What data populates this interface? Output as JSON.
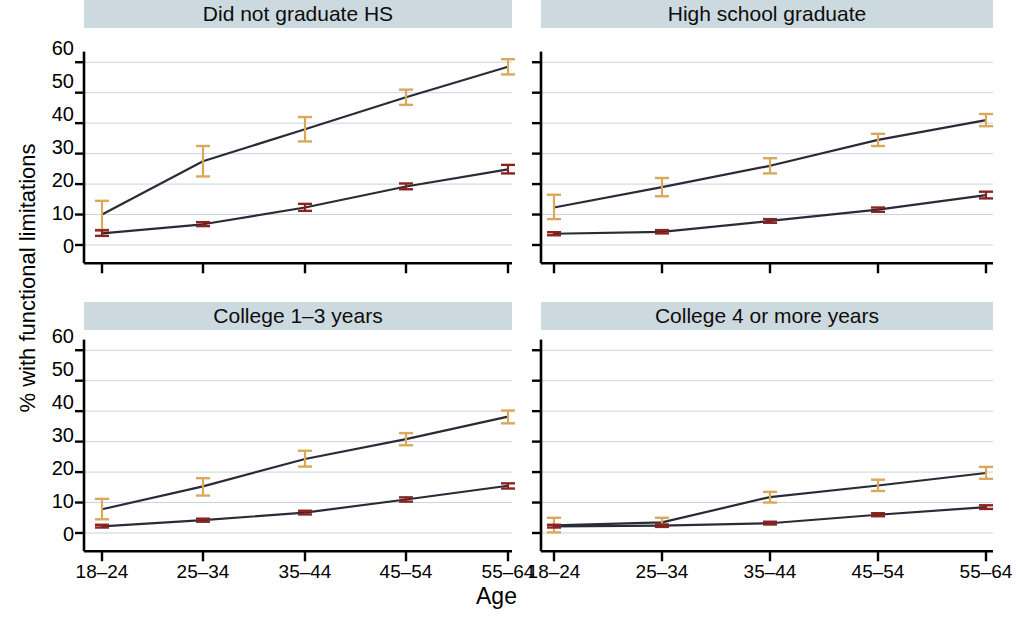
{
  "chart_data": {
    "type": "line",
    "title": "",
    "xlabel": "Age",
    "ylabel": "% with functional limitations",
    "categories": [
      "18–24",
      "25–34",
      "35–44",
      "45–54",
      "55–64"
    ],
    "ylim": [
      0,
      65
    ],
    "yticks": [
      0,
      10,
      20,
      30,
      40,
      50,
      60
    ],
    "ytick_labels": [
      "0",
      "10",
      "20",
      "30",
      "40",
      "50",
      "60"
    ],
    "grid": true,
    "grid_axis": "y",
    "legend_position": "none",
    "facet_layout": {
      "rows": 2,
      "cols": 2
    },
    "series_colors": {
      "upper": "#d9a85a",
      "lower": "#8c2323",
      "line": "#2b2b38"
    },
    "panels": [
      {
        "id": "did-not-graduate-hs",
        "title": "Did not graduate HS",
        "row": 0,
        "col": 0,
        "series": [
          {
            "name": "upper",
            "marker_color": "#d9a85a",
            "values": [
              10.0,
              27.5,
              38.0,
              48.5,
              58.5
            ],
            "err_low": [
              5.0,
              22.5,
              34.0,
              46.0,
              56.0
            ],
            "err_high": [
              14.5,
              32.5,
              42.0,
              51.0,
              61.0
            ]
          },
          {
            "name": "lower",
            "marker_color": "#8c2323",
            "values": [
              3.8,
              6.8,
              12.3,
              19.2,
              24.8
            ],
            "err_low": [
              3.0,
              6.2,
              11.2,
              18.3,
              23.5
            ],
            "err_high": [
              4.8,
              7.5,
              13.5,
              20.2,
              26.3
            ]
          }
        ]
      },
      {
        "id": "high-school-graduate",
        "title": "High school graduate",
        "row": 0,
        "col": 1,
        "series": [
          {
            "name": "upper",
            "marker_color": "#d9a85a",
            "values": [
              12.3,
              19.0,
              26.0,
              34.5,
              41.0
            ],
            "err_low": [
              8.5,
              16.0,
              23.5,
              32.5,
              39.0
            ],
            "err_high": [
              16.5,
              22.0,
              28.5,
              36.5,
              43.0
            ]
          },
          {
            "name": "lower",
            "marker_color": "#8c2323",
            "values": [
              3.7,
              4.3,
              7.9,
              11.6,
              16.4
            ],
            "err_low": [
              3.2,
              3.8,
              7.3,
              10.9,
              15.3
            ],
            "err_high": [
              4.2,
              4.9,
              8.5,
              12.3,
              17.5
            ]
          }
        ]
      },
      {
        "id": "college-1-3-years",
        "title": "College 1–3 years",
        "row": 1,
        "col": 0,
        "series": [
          {
            "name": "upper",
            "marker_color": "#d9a85a",
            "values": [
              7.8,
              15.3,
              24.3,
              30.8,
              38.2
            ],
            "err_low": [
              4.5,
              12.3,
              21.8,
              28.8,
              36.0
            ],
            "err_high": [
              11.2,
              18.0,
              27.0,
              32.8,
              40.2
            ]
          },
          {
            "name": "lower",
            "marker_color": "#8c2323",
            "values": [
              2.2,
              4.2,
              6.7,
              11.0,
              15.5
            ],
            "err_low": [
              1.8,
              3.7,
              6.1,
              10.3,
              14.6
            ],
            "err_high": [
              2.7,
              4.7,
              7.3,
              11.7,
              16.3
            ]
          }
        ]
      },
      {
        "id": "college-4-or-more-years",
        "title": "College 4 or more years",
        "row": 1,
        "col": 1,
        "series": [
          {
            "name": "upper",
            "marker_color": "#d9a85a",
            "values": [
              2.5,
              3.5,
              11.8,
              15.6,
              19.7
            ],
            "err_low": [
              0.2,
              2.3,
              10.0,
              13.8,
              17.8
            ],
            "err_high": [
              5.0,
              5.0,
              13.5,
              17.5,
              21.7
            ]
          },
          {
            "name": "lower",
            "marker_color": "#8c2323",
            "values": [
              2.2,
              2.4,
              3.2,
              6.0,
              8.5
            ],
            "err_low": [
              1.8,
              2.0,
              2.8,
              5.5,
              7.9
            ],
            "err_high": [
              2.7,
              2.8,
              3.7,
              6.5,
              9.1
            ]
          }
        ]
      }
    ]
  }
}
